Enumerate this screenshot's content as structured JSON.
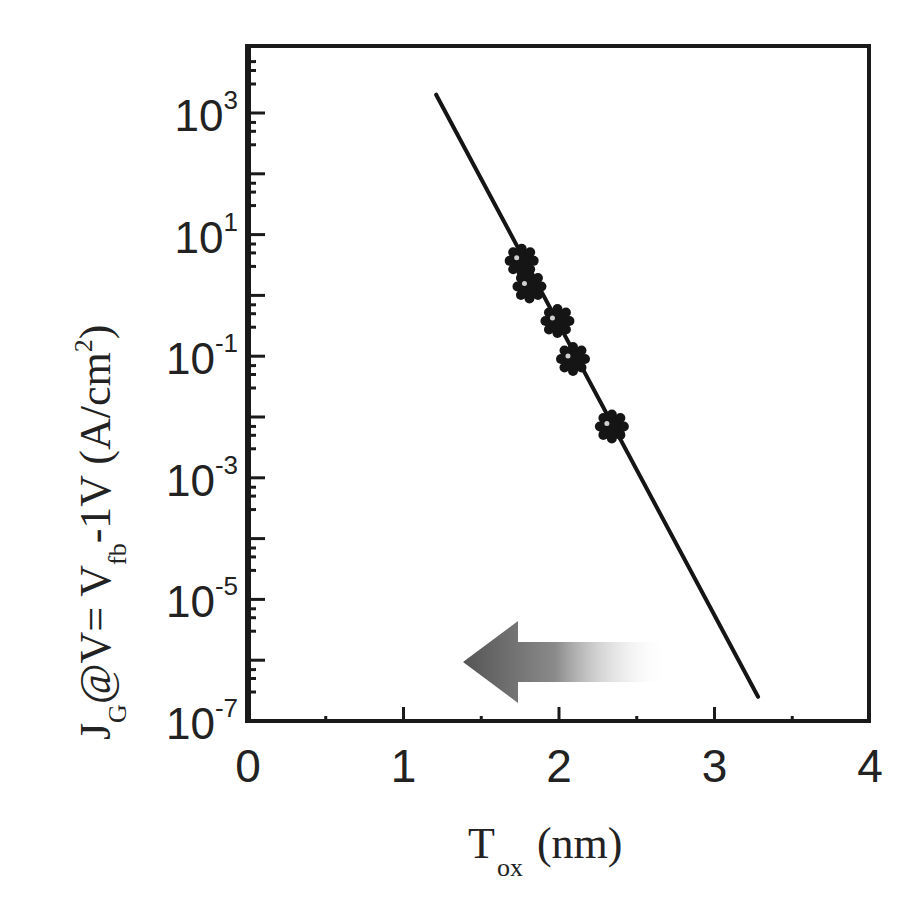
{
  "chart_data": {
    "type": "scatter",
    "title": "",
    "xlabel": "T_ox (nm)",
    "xlabel_main": "T",
    "xlabel_sub": "ox",
    "xlabel_unit": "(nm)",
    "ylabel": "J_G @ V= V_fb -1V (A/cm^2)",
    "ylabel_parts": {
      "j": "J",
      "j_sub": "G",
      "at_v": "@V= V",
      "v_sub": "fb",
      "rest": "-1V (A/cm",
      "sup": "2",
      "close": ")"
    },
    "xlim": [
      0,
      4
    ],
    "ylim": [
      1e-07,
      10000.0
    ],
    "yscale": "log",
    "x_ticks": [
      "0",
      "1",
      "2",
      "3",
      "4"
    ],
    "y_ticks": [
      {
        "base": "10",
        "exp": "3",
        "value": 1000
      },
      {
        "base": "10",
        "exp": "1",
        "value": 10
      },
      {
        "base": "10",
        "exp": "-1",
        "value": 0.1
      },
      {
        "base": "10",
        "exp": "-3",
        "value": 0.001
      },
      {
        "base": "10",
        "exp": "-5",
        "value": 1e-05
      },
      {
        "base": "10",
        "exp": "-7",
        "value": 1e-07
      }
    ],
    "grid": false,
    "legend": null,
    "series": [
      {
        "name": "measured",
        "marker": "flower-dot",
        "x": [
          1.76,
          1.81,
          1.99,
          2.09,
          2.34
        ],
        "y": [
          3.7,
          1.4,
          0.38,
          0.09,
          0.007
        ]
      },
      {
        "name": "fit line",
        "style": "line",
        "x": [
          1.21,
          3.28
        ],
        "y": [
          2000,
          2.5e-07
        ]
      }
    ],
    "annotations": [
      {
        "type": "arrow",
        "direction": "left",
        "style": "gradient gray",
        "x_from": 2.7,
        "x_to": 1.4,
        "y": 1e-06
      }
    ]
  },
  "colors": {
    "axis": "#1a1a1a",
    "marker": "#151515",
    "arrow_dark": "#555555",
    "arrow_light": "#ffffff"
  }
}
